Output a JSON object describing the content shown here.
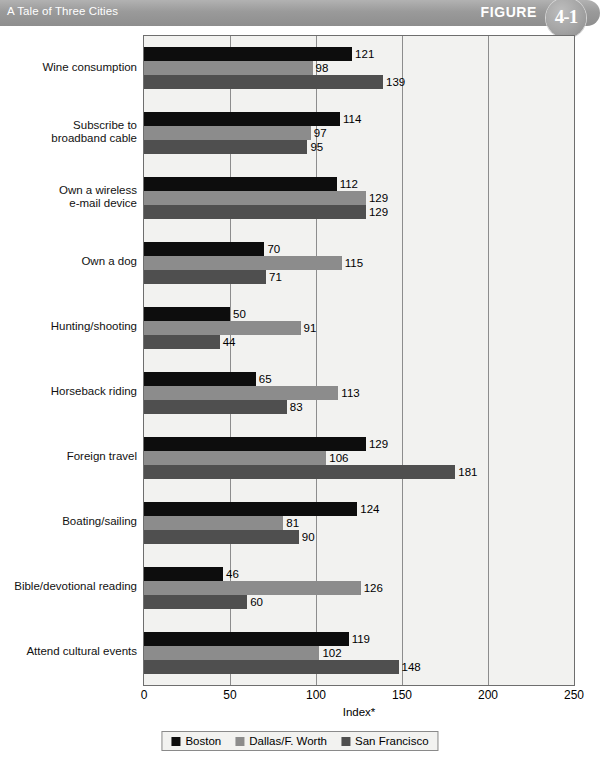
{
  "header": {
    "title": "A Tale of Three Cities",
    "figure_word": "FIGURE",
    "figure_number": "4-1"
  },
  "chart_data": {
    "type": "bar",
    "orientation": "horizontal",
    "title": "A Tale of Three Cities",
    "xlabel": "Index*",
    "ylabel": "",
    "xlim": [
      0,
      250
    ],
    "xticks": [
      0,
      50,
      100,
      150,
      200,
      250
    ],
    "grid": true,
    "legend_position": "bottom",
    "categories": [
      "Wine consumption",
      "Subscribe to\nbroadband cable",
      "Own a wireless\ne-mail device",
      "Own a dog",
      "Hunting/shooting",
      "Horseback riding",
      "Foreign travel",
      "Boating/sailing",
      "Bible/devotional reading",
      "Attend cultural events"
    ],
    "series": [
      {
        "name": "Boston",
        "color": "#0d0d0d",
        "values": [
          121,
          114,
          112,
          70,
          50,
          65,
          129,
          124,
          46,
          119
        ]
      },
      {
        "name": "Dallas/F. Worth",
        "color": "#8c8c8c",
        "values": [
          98,
          97,
          129,
          115,
          91,
          113,
          106,
          81,
          126,
          102
        ]
      },
      {
        "name": "San Francisco",
        "color": "#4f4f4f",
        "values": [
          139,
          95,
          129,
          71,
          44,
          83,
          181,
          90,
          60,
          148
        ]
      }
    ]
  }
}
